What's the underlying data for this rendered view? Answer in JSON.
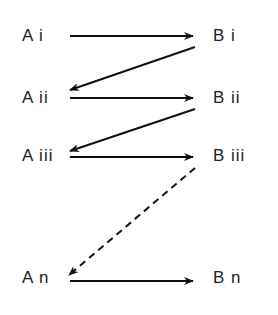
{
  "diagram": {
    "colors": {
      "text": "#222222",
      "line": "#111111",
      "background": "#ffffff"
    },
    "left_nodes": [
      {
        "label": "A i"
      },
      {
        "label": "A ii"
      },
      {
        "label": "A iii"
      },
      {
        "label": "A n"
      }
    ],
    "right_nodes": [
      {
        "label": "B i"
      },
      {
        "label": "B ii"
      },
      {
        "label": "B iii"
      },
      {
        "label": "B n"
      }
    ],
    "edges": [
      {
        "from": "A i",
        "to": "B i",
        "style": "solid"
      },
      {
        "from": "B i",
        "to": "A ii",
        "style": "solid"
      },
      {
        "from": "A ii",
        "to": "B ii",
        "style": "solid"
      },
      {
        "from": "B ii",
        "to": "A iii",
        "style": "solid"
      },
      {
        "from": "A iii",
        "to": "B iii",
        "style": "solid"
      },
      {
        "from": "B iii",
        "to": "A n",
        "style": "dashed"
      },
      {
        "from": "A n",
        "to": "B n",
        "style": "solid"
      }
    ]
  }
}
